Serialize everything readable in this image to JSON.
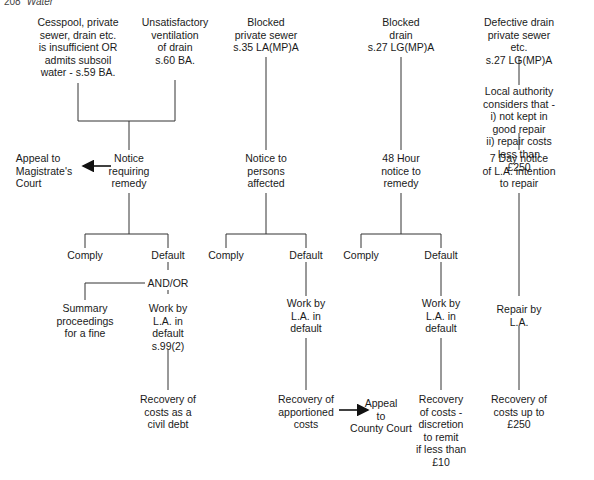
{
  "header": {
    "page_number": "208",
    "title": "Water"
  },
  "columns": [
    {
      "id": "col1",
      "triggers": [
        "Cesspool, private\nsewer, drain etc.\nis insufficient OR\nadmits subsoil\nwater - s.59 BA.",
        "Unsatisfactory\nventilation\nof drain\ns.60 BA."
      ],
      "notice": "Notice\nrequiring\nremedy",
      "appeal": "Appeal to\nMagistrate's\nCourt",
      "comply": "Comply",
      "default": "Default",
      "and_or": "AND/OR",
      "summary": "Summary\nproceedings\nfor a fine",
      "work": "Work by\nL.A. in\ndefault\ns.99(2)",
      "recovery": "Recovery of\ncosts as a\ncivil debt"
    },
    {
      "id": "col2",
      "trigger": "Blocked\nprivate sewer\ns.35 LA(MP)A",
      "notice": "Notice to\npersons\naffected",
      "comply": "Comply",
      "default": "Default",
      "work": "Work by\nL.A. in\ndefault",
      "recovery": "Recovery of\napportioned\ncosts",
      "appeal": "Appeal\nto\nCounty Court"
    },
    {
      "id": "col3",
      "trigger": "Blocked\ndrain\ns.27 LG(MP)A",
      "notice": "48 Hour\nnotice to\nremedy",
      "comply": "Comply",
      "default": "Default",
      "work": "Work by\nL.A. in\ndefault",
      "recovery": "Recovery\nof costs -\ndiscretion\nto remit\nif less than\n£10"
    },
    {
      "id": "col4",
      "trigger": "Defective drain\nprivate sewer etc.\ns.27 LG(MP)A",
      "condition": "Local authority considers that -\ni) not kept in good repair\nii) repair costs less than\n£250",
      "notice": "7 Day notice\nof L.A. intention\nto repair",
      "repair": "Repair by\nL.A.",
      "recovery": "Recovery of\ncosts up to\n£250"
    }
  ],
  "colors": {
    "line": "#333333",
    "text": "#1a1a1a",
    "background": "#ffffff"
  }
}
